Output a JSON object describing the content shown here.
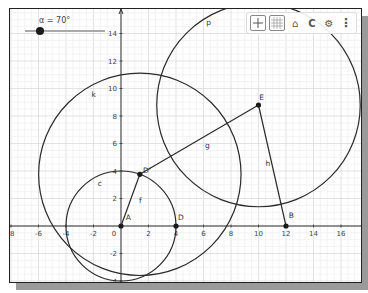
{
  "app": {
    "title": "Graphics View"
  },
  "slider": {
    "label": "α = 70°",
    "value_deg": 70
  },
  "toolbar": {
    "buttons": [
      {
        "name": "toggle-axes",
        "icon": "axes-icon"
      },
      {
        "name": "toggle-grid",
        "icon": "grid-icon"
      },
      {
        "name": "home",
        "icon": "home-icon"
      },
      {
        "name": "point-capturing",
        "icon": "magnet-icon"
      },
      {
        "name": "settings",
        "icon": "gear-icon"
      },
      {
        "name": "more",
        "icon": "kebab-menu-icon"
      }
    ],
    "home_glyph": "⌂",
    "capture_glyph": "C",
    "settings_glyph": "⚙",
    "more_glyph": "⋮"
  },
  "axes": {
    "x_ticks": [
      "-8",
      "-6",
      "-4",
      "-2",
      "0",
      "2",
      "4",
      "6",
      "8",
      "10",
      "12",
      "14",
      "16"
    ],
    "y_ticks": [
      "-4",
      "-2",
      "2",
      "4",
      "6",
      "8",
      "10",
      "12",
      "14"
    ]
  },
  "objects": {
    "points": [
      {
        "name": "A",
        "x": 0,
        "y": 0
      },
      {
        "name": "D",
        "x": 4,
        "y": 0
      },
      {
        "name": "D'",
        "x": 1.37,
        "y": 3.76
      },
      {
        "name": "E",
        "x": 10,
        "y": 8.8
      },
      {
        "name": "B",
        "x": 12,
        "y": 0
      }
    ],
    "segments": [
      {
        "name": "f",
        "from": "A",
        "to": "D'"
      },
      {
        "name": "g",
        "from": "D'",
        "to": "E"
      },
      {
        "name": "h",
        "from": "E",
        "to": "B"
      }
    ],
    "circles": [
      {
        "name": "c",
        "center": "A",
        "radius": 4
      },
      {
        "name": "k",
        "center": "D'",
        "radius": 7.36
      },
      {
        "name": "p",
        "center": "E",
        "radius": 7.4
      }
    ],
    "labels": {
      "A": "A",
      "D": "D",
      "Dp": "D'",
      "E": "E",
      "B": "B",
      "f": "f",
      "g": "g",
      "h": "h",
      "c": "c",
      "k": "k",
      "p": "p"
    }
  },
  "colors": {
    "curve": "#2a2a2a",
    "grid_major": "#d6d6d6",
    "grid_minor": "#eeeeee",
    "axis": "#333333"
  }
}
